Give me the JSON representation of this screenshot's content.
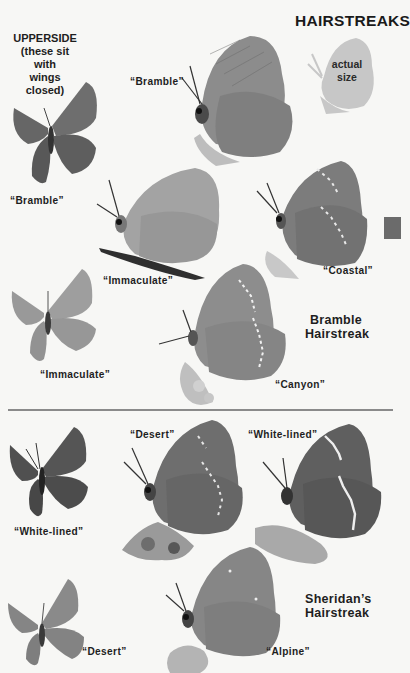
{
  "page": {
    "title": "HAIRSTREAKS",
    "upperside_heading": [
      "UPPERSIDE",
      "(these sit with",
      "wings closed)"
    ],
    "actual_size_label": [
      "actual",
      "size"
    ],
    "thumb_tab_color": "#6b6b6b"
  },
  "sections": [
    {
      "species": [
        "Bramble",
        "Hairstreak"
      ],
      "upperside": [
        {
          "label": "“Bramble”"
        },
        {
          "label": "“Immaculate”"
        }
      ],
      "underside": [
        {
          "label": "“Bramble”"
        },
        {
          "label": "“Immaculate”"
        },
        {
          "label": "“Coastal”"
        },
        {
          "label": "“Canyon”"
        }
      ]
    },
    {
      "species": [
        "Sheridan’s",
        "Hairstreak"
      ],
      "upperside": [
        {
          "label": "“White-lined”"
        },
        {
          "label": "“Desert”"
        }
      ],
      "underside": [
        {
          "label": "“Desert”"
        },
        {
          "label": "“White-lined”"
        },
        {
          "label": "“Alpine”"
        }
      ]
    }
  ],
  "colors": {
    "background": "#f7f7f5",
    "wing_light": "#9a9a9a",
    "wing_mid": "#7d7d7d",
    "wing_dark": "#5a5a5a",
    "silhouette": "#c9c9c9"
  }
}
